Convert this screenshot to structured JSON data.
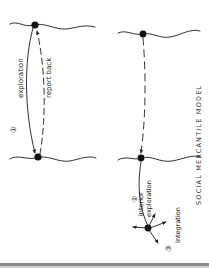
{
  "diagram": {
    "title": "SOCIAL MERCANTILE MODEL",
    "orientation": "rotated 90 degrees counter-clockwise",
    "colors": {
      "ink": "#1a1a1a",
      "paper": "#ffffff",
      "divider": "#8a8a8a"
    },
    "stages": [
      {
        "number": "1",
        "label": "exploration",
        "secondary_label": "report back"
      },
      {
        "number": "2",
        "label": "interior",
        "secondary_label": "exploration"
      },
      {
        "number": "3",
        "label": "integration"
      }
    ],
    "labels": {
      "stage1_number": "①",
      "stage1_outbound": "exploration",
      "stage1_return": "report back",
      "stage2_number": "②",
      "stage2_line1": "interior",
      "stage2_line2": "exploration",
      "stage3_number": "③",
      "stage3_label": "Integration",
      "title": "SOCIAL   MERCANTILE   MODEL"
    },
    "nodes": [
      {
        "id": "home-left",
        "description": "origin settlement on coastline (model 1)"
      },
      {
        "id": "colony-left",
        "description": "new-world point on coastline (model 1)"
      },
      {
        "id": "home-right",
        "description": "origin settlement on coastline (model 2)"
      },
      {
        "id": "colony-right",
        "description": "coastal entry point (model 2)"
      },
      {
        "id": "interior-node",
        "description": "interior integration point with radiating arrows"
      }
    ]
  }
}
